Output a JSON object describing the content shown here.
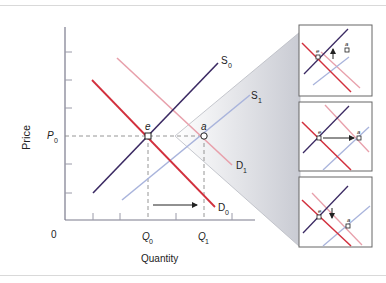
{
  "figure": {
    "y_axis_label": "Price",
    "x_axis_label": "Quantity",
    "origin_label": "0",
    "price_label": {
      "main": "P",
      "sub": "0"
    },
    "quantity_labels": [
      {
        "main": "Q",
        "sub": "0"
      },
      {
        "main": "Q",
        "sub": "1"
      }
    ],
    "curves": {
      "S0": {
        "main": "S",
        "sub": "0",
        "color": "#3b2a63"
      },
      "S1": {
        "main": "S",
        "sub": "1",
        "color": "#a9b4dc"
      },
      "D0": {
        "main": "D",
        "sub": "0",
        "color": "#d2303d"
      },
      "D1": {
        "main": "D",
        "sub": "1",
        "color": "#e8a0ab"
      }
    },
    "points": {
      "e": "e",
      "a": "a"
    },
    "panels": [
      {
        "name": "panel-top",
        "arrow": "up"
      },
      {
        "name": "panel-middle",
        "arrow": "right"
      },
      {
        "name": "panel-bottom",
        "arrow": "down"
      }
    ],
    "colors": {
      "axis": "#7a7a8c",
      "dashed": "#8a8a8a",
      "wedge": "#dcdde2",
      "panel_border": "#666666"
    }
  }
}
